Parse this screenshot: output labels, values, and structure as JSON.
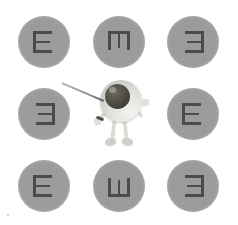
{
  "scene": {
    "title": "Tumbling E eye chart with eyeball mascot",
    "background_color": "#ffffff",
    "width": 238,
    "height": 225
  },
  "colors": {
    "circle_fill": "#9b9b9b",
    "letter_stroke": "#4b4b4b",
    "eyeball_white": "#e2e2de",
    "iris_dark": "#3e3d37",
    "limb": "#dedbd4",
    "pointer": "#8d8b85"
  },
  "chart": {
    "letter": "E",
    "rows": 3,
    "columns": 3,
    "optotypes": [
      {
        "id": "top-left",
        "letter": "E",
        "rotation": 0,
        "direction": "right",
        "row": 1,
        "col": 1
      },
      {
        "id": "top-center",
        "letter": "E",
        "rotation": 90,
        "direction": "down",
        "row": 1,
        "col": 2
      },
      {
        "id": "top-right",
        "letter": "E",
        "rotation": 180,
        "direction": "left",
        "row": 1,
        "col": 3
      },
      {
        "id": "middle-left",
        "letter": "E",
        "rotation": 180,
        "direction": "left",
        "row": 2,
        "col": 1
      },
      {
        "id": "middle-right",
        "letter": "E",
        "rotation": 0,
        "direction": "right",
        "row": 2,
        "col": 3
      },
      {
        "id": "bottom-left",
        "letter": "E",
        "rotation": 0,
        "direction": "right",
        "row": 3,
        "col": 1
      },
      {
        "id": "bottom-center",
        "letter": "E",
        "rotation": 270,
        "direction": "up",
        "row": 3,
        "col": 2
      },
      {
        "id": "bottom-right",
        "letter": "E",
        "rotation": 180,
        "direction": "left",
        "row": 3,
        "col": 3
      }
    ]
  },
  "mascot": {
    "name": "eyeball-character",
    "pointing_at": "middle-left",
    "holds": "pointer-stick"
  }
}
